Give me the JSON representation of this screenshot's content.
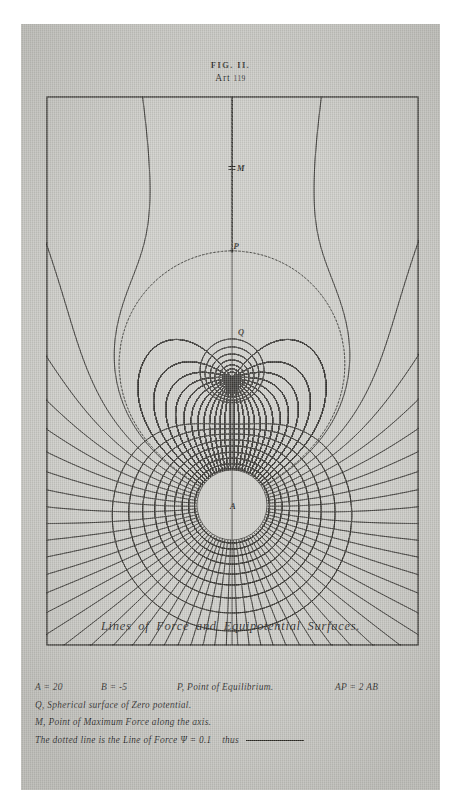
{
  "plate": {
    "fig_label": "FIG. II.",
    "art_word": "Art",
    "art_number": "119",
    "caption": "Lines of Force and Equipotential Surfaces.",
    "background_color": "#c9c9c4",
    "ink_color": "#1b1a16"
  },
  "legend": {
    "charge_a": "A = 20",
    "charge_b": "B = -5",
    "point_p": "P, Point of Equilibrium.",
    "relation_ap": "AP = 2 AB",
    "line_q": "Q, Spherical surface of Zero potential.",
    "line_m": "M, Point of Maximum Force along the axis.",
    "line_dotted_pre": "The dotted line is the Line of Force",
    "line_dotted_psi": "Ψ = 0.1",
    "line_dotted_post": "thus"
  },
  "diagram_labels": {
    "a": "A",
    "b": "B",
    "p": "P",
    "q": "Q",
    "m": "M"
  },
  "chart_data": {
    "type": "line",
    "title": "Lines of Force and Equipotential Surfaces",
    "xlabel": "",
    "ylabel": "",
    "grid": false,
    "legend_position": "below-figure",
    "frame": {
      "x": 26,
      "y": 73,
      "width": 371,
      "height": 548
    },
    "axis_x": 211,
    "charges": [
      {
        "name": "A",
        "value": 20,
        "x": 211,
        "y": 481,
        "blank_radius": 35
      },
      {
        "name": "B",
        "value": -5,
        "x": 211,
        "y": 354,
        "blank_radius": 0
      }
    ],
    "points": [
      {
        "name": "P",
        "label": "Point of Equilibrium",
        "x": 211,
        "y": 227
      },
      {
        "name": "M",
        "label": "Point of Maximum Force along the axis",
        "x": 211,
        "y": 144
      },
      {
        "name": "Q",
        "label": "Spherical surface of Zero potential",
        "x": 216,
        "y": 311
      }
    ],
    "series": [
      {
        "name": "lines-of-force",
        "count": 40,
        "style": "solid",
        "note": "stream function Psi constant, radiating from A"
      },
      {
        "name": "equipotentials",
        "count": 22,
        "style": "solid",
        "note": "potential V constant, closed loops about A and B"
      },
      {
        "name": "dotted-line-of-force",
        "count": 2,
        "style": "dotted",
        "note": "Psi = 0.1 separatrix through P"
      }
    ],
    "ylim": [
      73,
      621
    ],
    "xlim": [
      26,
      397
    ]
  }
}
